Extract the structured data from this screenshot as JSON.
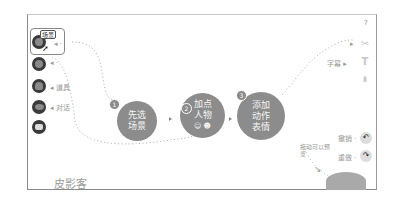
{
  "app": {
    "brand": "皮影客"
  },
  "toolbar_left": {
    "tools": [
      {
        "name": "scene-tool",
        "badge": "场景",
        "hint": ""
      },
      {
        "name": "character-tool",
        "hint": ""
      },
      {
        "name": "prop-tool",
        "hint": "道具"
      },
      {
        "name": "dialog-tool",
        "hint": "对话"
      },
      {
        "name": "caption-tool",
        "hint": ""
      }
    ]
  },
  "steps": [
    {
      "num": "1",
      "line1": "先选",
      "line2": "场景"
    },
    {
      "num": "2",
      "line1": "加点",
      "line2": "人物"
    },
    {
      "num": "3",
      "line1": "添加",
      "line2": "动作",
      "line3": "表情"
    }
  ],
  "toolbar_right": {
    "help": "?",
    "items": [
      {
        "name": "tools-icon",
        "glyph": "✂"
      },
      {
        "name": "subtitle-icon",
        "glyph": "T",
        "hint": "字幕"
      },
      {
        "name": "audio-icon",
        "glyph": "▮"
      }
    ],
    "undo": {
      "label": "撤销",
      "glyph": "↶"
    },
    "redo": {
      "label": "重做",
      "glyph": "↷"
    }
  },
  "annotation_preview": "拖动可以预览",
  "colors": {
    "frame": "#8a8a8a",
    "step_fill": "#8c8c8c",
    "tool_fill": "#3a3a3a"
  }
}
